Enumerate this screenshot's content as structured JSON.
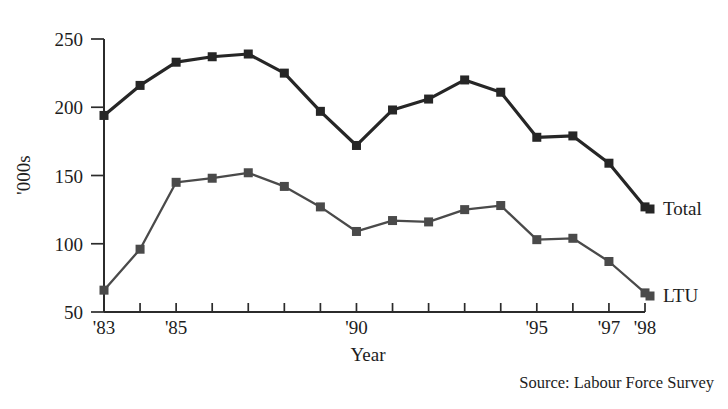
{
  "chart_data": {
    "type": "line",
    "title": "",
    "xlabel": "Year",
    "ylabel": "'000s",
    "x": [
      1983,
      1984,
      1985,
      1986,
      1987,
      1988,
      1989,
      1990,
      1991,
      1992,
      1993,
      1994,
      1995,
      1996,
      1997,
      1998
    ],
    "categories": [
      "'83",
      "'84",
      "'85",
      "'86",
      "'87",
      "'88",
      "'89",
      "'90",
      "'91",
      "'92",
      "'93",
      "'94",
      "'95",
      "'96",
      "'97",
      "'98"
    ],
    "x_tick_labels_visible": [
      "'83",
      "'85",
      "'90",
      "'95",
      "'97",
      "'98"
    ],
    "y_tick_labels": [
      "250",
      "200",
      "150",
      "100",
      "50"
    ],
    "ylim": [
      50,
      250
    ],
    "xlim": [
      1983,
      1998
    ],
    "grid": false,
    "legend": "inline-right",
    "series": [
      {
        "name": "Total",
        "color": "#262626",
        "marker": "square",
        "values": [
          194,
          216,
          233,
          237,
          239,
          225,
          197,
          172,
          198,
          206,
          220,
          211,
          178,
          179,
          159,
          127
        ]
      },
      {
        "name": "LTU",
        "color": "#4a4a4a",
        "marker": "square",
        "values": [
          66,
          96,
          145,
          148,
          152,
          142,
          127,
          109,
          117,
          116,
          125,
          128,
          103,
          104,
          87,
          64
        ]
      }
    ],
    "source_note": "Source: Labour Force Survey"
  },
  "axis": {
    "y_title": "'000s",
    "x_title": "Year"
  },
  "labels": {
    "total": "Total",
    "ltu": "LTU"
  },
  "footer": {
    "source": "Source: Labour Force Survey"
  }
}
